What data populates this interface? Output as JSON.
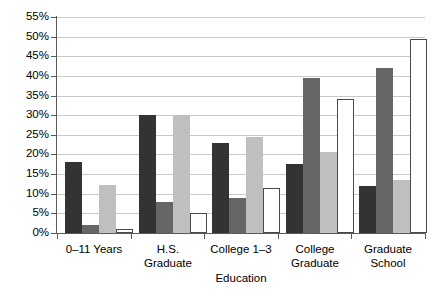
{
  "chart_data": {
    "type": "bar",
    "title": "",
    "xlabel": "Education",
    "ylabel": "",
    "categories": [
      "0–11 Years",
      "H.S.\nGraduate",
      "College 1–3",
      "College\nGraduate",
      "Graduate\nSchool"
    ],
    "ytick_labels": [
      "0%",
      "5%",
      "10%",
      "15%",
      "20%",
      "25%",
      "30%",
      "35%",
      "40%",
      "45%",
      "50%",
      "55%"
    ],
    "ytick_values": [
      0,
      5,
      10,
      15,
      20,
      25,
      30,
      35,
      40,
      45,
      50,
      55
    ],
    "ylim": [
      0,
      55
    ],
    "grid": true,
    "legend": "none",
    "series": [
      {
        "name": "series-1",
        "color": "#333333",
        "values": [
          18.0,
          30.0,
          23.0,
          17.5,
          12.0
        ]
      },
      {
        "name": "series-2",
        "color": "#666666",
        "values": [
          2.0,
          8.0,
          9.0,
          39.5,
          42.0
        ]
      },
      {
        "name": "series-3",
        "color": "#bfbfbf",
        "values": [
          12.2,
          30.0,
          24.5,
          20.5,
          13.5
        ]
      },
      {
        "name": "series-4",
        "color": "#ffffff",
        "values": [
          1.0,
          5.0,
          11.5,
          34.0,
          49.5
        ]
      }
    ]
  },
  "axis": {
    "x_title": "Education"
  },
  "categories_display": [
    {
      "line1": "0–11 Years",
      "line2": ""
    },
    {
      "line1": "H.S.",
      "line2": "Graduate"
    },
    {
      "line1": "College 1–3",
      "line2": ""
    },
    {
      "line1": "College",
      "line2": "Graduate"
    },
    {
      "line1": "Graduate",
      "line2": "School"
    }
  ]
}
